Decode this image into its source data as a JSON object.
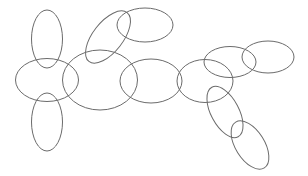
{
  "diagram": {
    "background": "#ffffff",
    "stroke_color": "#6b6b6b",
    "ellipses": [
      {
        "id": "top-left-vertical",
        "cx": 47,
        "cy": 39,
        "rx": 15.5,
        "ry": 29,
        "rotate": 0
      },
      {
        "id": "left-horizontal",
        "cx": 47,
        "cy": 80,
        "rx": 31.5,
        "ry": 21.5,
        "rotate": 0
      },
      {
        "id": "bottom-left-vertical",
        "cx": 47,
        "cy": 122,
        "rx": 15.5,
        "ry": 29,
        "rotate": 0
      },
      {
        "id": "center-large",
        "cx": 100,
        "cy": 80,
        "rx": 37.5,
        "ry": 30,
        "rotate": 0
      },
      {
        "id": "upper-tilted",
        "cx": 108,
        "cy": 37,
        "rx": 31,
        "ry": 15,
        "rotate": -52
      },
      {
        "id": "top-right-of-tilted",
        "cx": 145,
        "cy": 25,
        "rx": 28,
        "ry": 17,
        "rotate": 0
      },
      {
        "id": "middle",
        "cx": 151,
        "cy": 81,
        "rx": 31,
        "ry": 22,
        "rotate": 0
      },
      {
        "id": "middle-right",
        "cx": 205,
        "cy": 81,
        "rx": 28,
        "ry": 21.5,
        "rotate": 0
      },
      {
        "id": "upper-right",
        "cx": 230,
        "cy": 62,
        "rx": 26,
        "ry": 15.5,
        "rotate": 0
      },
      {
        "id": "far-right",
        "cx": 268,
        "cy": 57,
        "rx": 26,
        "ry": 16,
        "rotate": 0
      },
      {
        "id": "lower-tilted",
        "cx": 225,
        "cy": 112,
        "rx": 28,
        "ry": 14,
        "rotate": 62
      },
      {
        "id": "bottom-tilted",
        "cx": 250,
        "cy": 145,
        "rx": 27,
        "ry": 14.5,
        "rotate": 58
      }
    ]
  }
}
